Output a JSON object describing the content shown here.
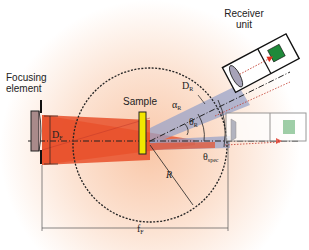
{
  "labels": {
    "receiver": [
      "Receiver",
      "unit"
    ],
    "focusing": [
      "Focusing",
      "element"
    ],
    "sample": "Sample"
  },
  "symbols": {
    "D_F": {
      "main": "D",
      "sub": "F"
    },
    "D_R": {
      "main": "D",
      "sub": "R"
    },
    "alpha_R": {
      "main": "α",
      "sub": "R"
    },
    "theta_R": {
      "main": "θ",
      "sub": "R"
    },
    "theta_spec": {
      "main": "θ",
      "sub": "spec"
    },
    "R": {
      "main": "R",
      "sub": ""
    },
    "f_F": {
      "main": "f",
      "sub": "F"
    }
  },
  "colors": {
    "beam": "#e8502a",
    "reflected_beam": "#9aa3c8",
    "sample": "#f2e600",
    "detector": "#1f8a3a",
    "detector_faded": "#7fbf8c",
    "glow": "#fbd9c4"
  }
}
